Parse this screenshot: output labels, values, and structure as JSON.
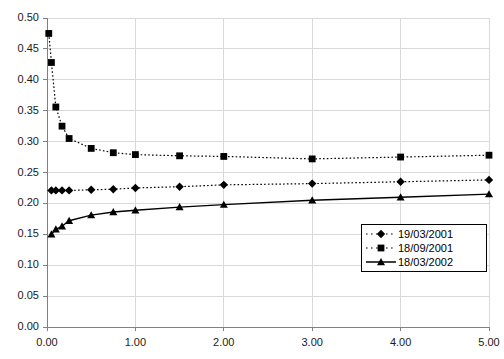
{
  "chart_data": {
    "type": "line",
    "title": "",
    "subtitle": "",
    "xlabel": "",
    "ylabel": "",
    "xlim": [
      0.0,
      5.0
    ],
    "ylim": [
      0.0,
      0.5
    ],
    "xticks": [
      "0.00",
      "1.00",
      "2.00",
      "3.00",
      "4.00",
      "5.00"
    ],
    "xtick_values": [
      0.0,
      1.0,
      2.0,
      3.0,
      4.0,
      5.0
    ],
    "yticks": [
      "0.00",
      "0.05",
      "0.10",
      "0.15",
      "0.20",
      "0.25",
      "0.30",
      "0.35",
      "0.40",
      "0.45",
      "0.50"
    ],
    "ytick_values": [
      0.0,
      0.05,
      0.1,
      0.15,
      0.2,
      0.25,
      0.3,
      0.35,
      0.4,
      0.45,
      0.5
    ],
    "grid": true,
    "grid_color": "#d9d9d9",
    "axis_color": "#808080",
    "legend_position": "bottom-right",
    "series": [
      {
        "name": "19/03/2001",
        "marker": "diamond",
        "linestyle": "dotted",
        "color": "#000000",
        "x": [
          0.05,
          0.1,
          0.17,
          0.25,
          0.5,
          0.75,
          1.0,
          1.5,
          2.0,
          3.0,
          4.0,
          5.0
        ],
        "values": [
          0.221,
          0.221,
          0.221,
          0.221,
          0.222,
          0.223,
          0.225,
          0.227,
          0.23,
          0.232,
          0.235,
          0.238
        ]
      },
      {
        "name": "18/09/2001",
        "marker": "square",
        "linestyle": "dotted",
        "color": "#000000",
        "x": [
          0.02,
          0.05,
          0.1,
          0.17,
          0.25,
          0.5,
          0.75,
          1.0,
          1.5,
          2.0,
          3.0,
          4.0,
          5.0
        ],
        "values": [
          0.475,
          0.428,
          0.356,
          0.325,
          0.305,
          0.289,
          0.282,
          0.279,
          0.277,
          0.276,
          0.272,
          0.275,
          0.278
        ]
      },
      {
        "name": "18/03/2002",
        "marker": "triangle",
        "linestyle": "solid",
        "color": "#000000",
        "x": [
          0.05,
          0.1,
          0.17,
          0.25,
          0.5,
          0.75,
          1.0,
          1.5,
          2.0,
          3.0,
          4.0,
          5.0
        ],
        "values": [
          0.15,
          0.158,
          0.163,
          0.172,
          0.181,
          0.186,
          0.189,
          0.194,
          0.198,
          0.205,
          0.21,
          0.215
        ]
      }
    ]
  },
  "legend": {
    "entries": [
      {
        "label": "19/03/2001"
      },
      {
        "label": "18/09/2001"
      },
      {
        "label": "18/03/2002"
      }
    ]
  }
}
